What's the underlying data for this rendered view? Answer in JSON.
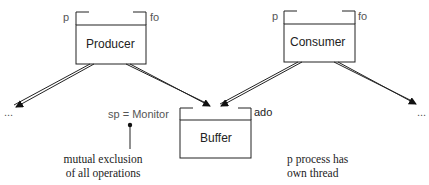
{
  "diagram": {
    "nodes": {
      "producer": {
        "label": "Producer",
        "left_tag": "p",
        "right_tag": "fo"
      },
      "consumer": {
        "label": "Consumer",
        "left_tag": "p",
        "right_tag": "fo"
      },
      "buffer": {
        "label": "Buffer",
        "right_tag": "ado"
      }
    },
    "monitor_label": "sp = Monitor",
    "ellipsis_left": "...",
    "ellipsis_right": "...",
    "annotations": {
      "mutex_line1": "mutual exclusion",
      "mutex_line2": "of all operations",
      "process_line1": "p process has",
      "process_line2": "own thread"
    },
    "colors": {
      "stroke": "#222222",
      "background": "#ffffff",
      "tag_text": "#555555"
    }
  }
}
